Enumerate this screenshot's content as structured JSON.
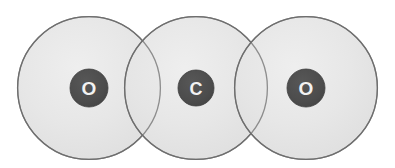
{
  "diagram": {
    "formula": "CO2",
    "background_color": "#ffffff",
    "canvas": {
      "width": 395,
      "height": 168
    },
    "shell": {
      "fill_color": "#e3e3e3",
      "fill_color_light": "#ececec",
      "outline_color": "#6e6e6e",
      "outline_width": 1.3,
      "opacity": 0.86,
      "radius": 72
    },
    "nucleus": {
      "fill_color": "#4d4d4d",
      "label_color": "#f2f2f2",
      "outline_color": "#3f3f3f"
    },
    "atoms": [
      {
        "element": "O",
        "name": "oxygen-left",
        "label": "O",
        "center_x": 89,
        "center_y": 88,
        "shell_radius": 72,
        "nucleus_radius": 19,
        "label_font_size": 19
      },
      {
        "element": "C",
        "name": "carbon-center",
        "label": "C",
        "center_x": 196,
        "center_y": 88,
        "shell_radius": 72,
        "nucleus_radius": 18,
        "label_font_size": 18
      },
      {
        "element": "O",
        "name": "oxygen-right",
        "label": "O",
        "center_x": 306,
        "center_y": 88,
        "shell_radius": 72,
        "nucleus_radius": 19,
        "label_font_size": 19
      }
    ]
  }
}
